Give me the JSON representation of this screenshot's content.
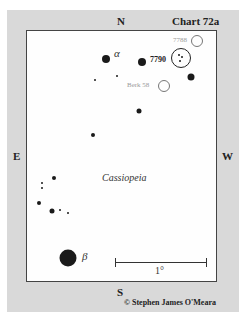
{
  "chart_title": "Chart 72a",
  "directions": {
    "north": "N",
    "south": "S",
    "east": "E",
    "west": "W"
  },
  "constellation": "Cassiopeia",
  "star_labels": {
    "alpha": "α",
    "beta": "β"
  },
  "objects": {
    "ngc7790": "7790",
    "ngc7788": "7788",
    "berk58": "Berk 58"
  },
  "scale_label": "1°",
  "copyright": "© Stephen James O'Meara",
  "colors": {
    "panel": "#d9d9d9",
    "chart_bg": "#fefefe",
    "star": "#1a1a1a",
    "faint_label": "#9a9a9a"
  }
}
